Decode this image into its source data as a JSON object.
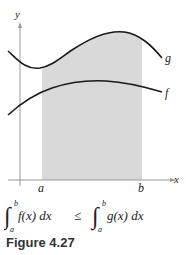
{
  "figure": {
    "caption": "Figure 4.27",
    "axes": {
      "x_label": "x",
      "y_label": "y"
    },
    "curves": [
      {
        "name": "g",
        "label": "g",
        "position": "upper"
      },
      {
        "name": "f",
        "label": "f",
        "position": "lower"
      }
    ],
    "bounds": {
      "a": "a",
      "b": "b"
    },
    "shaded_region": {
      "from": "a",
      "to": "b",
      "color": "#d9d9d9"
    },
    "formula": {
      "left_integrand": "f(x) dx",
      "right_integrand": "g(x) dx",
      "relation": "≤",
      "lower_limit": "a",
      "upper_limit": "b"
    }
  },
  "colors": {
    "axis": "#999999",
    "curve": "#1a1a1a",
    "shade": "#d9d9d9",
    "text": "#222222"
  }
}
